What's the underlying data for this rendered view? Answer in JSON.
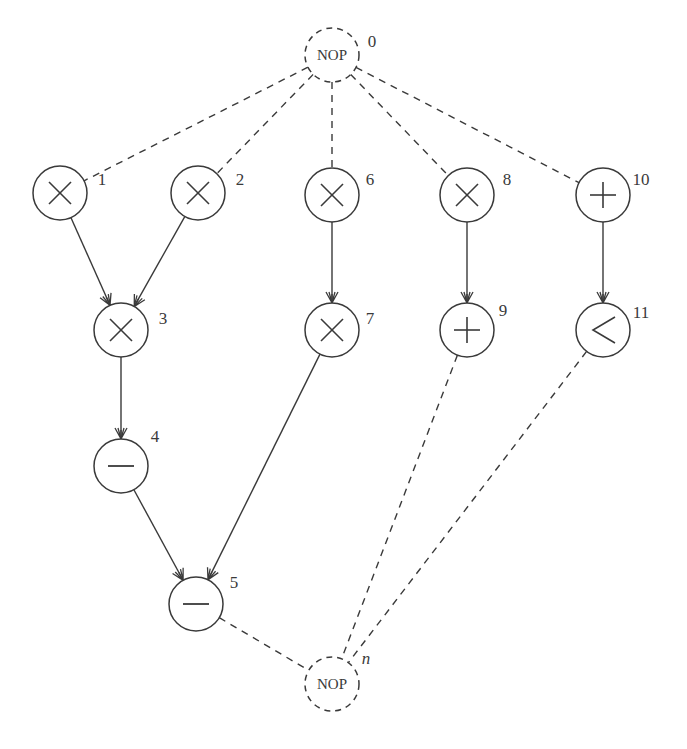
{
  "diagram": {
    "type": "sequencing-graph",
    "colors": {
      "stroke": "#3a3a3a",
      "background": "#ffffff"
    },
    "node_radius": 27,
    "nodes": [
      {
        "id": "0",
        "label": "0",
        "op": "NOP",
        "symbol": "NOP",
        "kind": "nop",
        "x": 332,
        "y": 55,
        "label_dx": 40,
        "label_dy": -8,
        "italic": false
      },
      {
        "id": "1",
        "label": "1",
        "op": "multiply",
        "symbol": "×",
        "kind": "op",
        "x": 60,
        "y": 193,
        "label_dx": 42,
        "label_dy": -8,
        "italic": false
      },
      {
        "id": "2",
        "label": "2",
        "op": "multiply",
        "symbol": "×",
        "kind": "op",
        "x": 198,
        "y": 193,
        "label_dx": 42,
        "label_dy": -8,
        "italic": false
      },
      {
        "id": "3",
        "label": "3",
        "op": "multiply",
        "symbol": "×",
        "kind": "op",
        "x": 121,
        "y": 330,
        "label_dx": 42,
        "label_dy": -6,
        "italic": false
      },
      {
        "id": "4",
        "label": "4",
        "op": "subtract",
        "symbol": "−",
        "kind": "op",
        "x": 121,
        "y": 466,
        "label_dx": 34,
        "label_dy": -24,
        "italic": false
      },
      {
        "id": "5",
        "label": "5",
        "op": "subtract",
        "symbol": "−",
        "kind": "op",
        "x": 196,
        "y": 604,
        "label_dx": 38,
        "label_dy": -16,
        "italic": false
      },
      {
        "id": "6",
        "label": "6",
        "op": "multiply",
        "symbol": "×",
        "kind": "op",
        "x": 332,
        "y": 195,
        "label_dx": 38,
        "label_dy": -10,
        "italic": false
      },
      {
        "id": "7",
        "label": "7",
        "op": "multiply",
        "symbol": "×",
        "kind": "op",
        "x": 332,
        "y": 330,
        "label_dx": 38,
        "label_dy": -6,
        "italic": false
      },
      {
        "id": "8",
        "label": "8",
        "op": "multiply",
        "symbol": "×",
        "kind": "op",
        "x": 467,
        "y": 195,
        "label_dx": 40,
        "label_dy": -10,
        "italic": false
      },
      {
        "id": "9",
        "label": "9",
        "op": "add",
        "symbol": "+",
        "kind": "op",
        "x": 467,
        "y": 330,
        "label_dx": 36,
        "label_dy": -14,
        "italic": false
      },
      {
        "id": "10",
        "label": "10",
        "op": "add",
        "symbol": "+",
        "kind": "op",
        "x": 603,
        "y": 195,
        "label_dx": 38,
        "label_dy": -10,
        "italic": false
      },
      {
        "id": "11",
        "label": "11",
        "op": "compare-less-than",
        "symbol": "<",
        "kind": "op",
        "x": 603,
        "y": 330,
        "label_dx": 38,
        "label_dy": -12,
        "italic": false
      },
      {
        "id": "n",
        "label": "n",
        "op": "NOP",
        "symbol": "NOP",
        "kind": "nop",
        "x": 332,
        "y": 684,
        "label_dx": 34,
        "label_dy": -20,
        "italic": true
      }
    ],
    "edges": [
      {
        "from": "0",
        "to": "1",
        "style": "dashed",
        "arrow": false
      },
      {
        "from": "0",
        "to": "2",
        "style": "dashed",
        "arrow": false
      },
      {
        "from": "0",
        "to": "6",
        "style": "dashed",
        "arrow": false
      },
      {
        "from": "0",
        "to": "8",
        "style": "dashed",
        "arrow": false
      },
      {
        "from": "0",
        "to": "10",
        "style": "dashed",
        "arrow": false
      },
      {
        "from": "1",
        "to": "3",
        "style": "solid",
        "arrow": true
      },
      {
        "from": "2",
        "to": "3",
        "style": "solid",
        "arrow": true
      },
      {
        "from": "3",
        "to": "4",
        "style": "solid",
        "arrow": true
      },
      {
        "from": "4",
        "to": "5",
        "style": "solid",
        "arrow": true
      },
      {
        "from": "6",
        "to": "7",
        "style": "solid",
        "arrow": true
      },
      {
        "from": "7",
        "to": "5",
        "style": "solid",
        "arrow": true
      },
      {
        "from": "8",
        "to": "9",
        "style": "solid",
        "arrow": true
      },
      {
        "from": "10",
        "to": "11",
        "style": "solid",
        "arrow": true
      },
      {
        "from": "5",
        "to": "n",
        "style": "dashed",
        "arrow": false
      },
      {
        "from": "9",
        "to": "n",
        "style": "dashed",
        "arrow": false
      },
      {
        "from": "11",
        "to": "n",
        "style": "dashed",
        "arrow": false
      }
    ]
  }
}
